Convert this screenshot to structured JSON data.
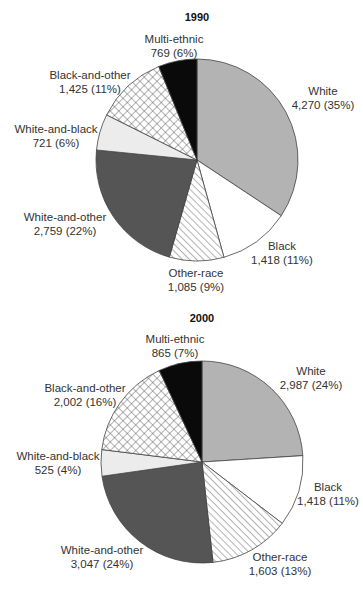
{
  "chart_data": [
    {
      "type": "pie",
      "title": "1990",
      "start_angle": "12 o'clock, clockwise",
      "categories": [
        "White",
        "Black",
        "Other-race",
        "White-and-other",
        "White-and-black",
        "Black-and-other",
        "Multi-ethnic"
      ],
      "values": [
        4270,
        1418,
        1085,
        2759,
        721,
        1425,
        769
      ],
      "percents": [
        35,
        11,
        9,
        22,
        6,
        11,
        6
      ],
      "labels": [
        {
          "name": "White",
          "value": "4,270 (35%)"
        },
        {
          "name": "Black",
          "value": "1,418 (11%)"
        },
        {
          "name": "Other-race",
          "value": "1,085 (9%)"
        },
        {
          "name": "White-and-other",
          "value": "2,759 (22%)"
        },
        {
          "name": "White-and-black",
          "value": "721 (6%)"
        },
        {
          "name": "Black-and-other",
          "value": "1,425 (11%)"
        },
        {
          "name": "Multi-ethnic",
          "value": "769 (6%)"
        }
      ]
    },
    {
      "type": "pie",
      "title": "2000",
      "start_angle": "12 o'clock, clockwise",
      "categories": [
        "White",
        "Black",
        "Other-race",
        "White-and-other",
        "White-and-black",
        "Black-and-other",
        "Multi-ethnic"
      ],
      "values": [
        2987,
        1418,
        1603,
        3047,
        525,
        2002,
        865
      ],
      "percents": [
        24,
        11,
        13,
        24,
        4,
        16,
        7
      ],
      "labels": [
        {
          "name": "White",
          "value": "2,987 (24%)"
        },
        {
          "name": "Black",
          "value": "1,418 (11%)"
        },
        {
          "name": "Other-race",
          "value": "1,603 (13%)"
        },
        {
          "name": "White-and-other",
          "value": "3,047 (24%)"
        },
        {
          "name": "White-and-black",
          "value": "525 (4%)"
        },
        {
          "name": "Black-and-other",
          "value": "2,002 (16%)"
        },
        {
          "name": "Multi-ethnic",
          "value": "865 (7%)"
        }
      ]
    }
  ],
  "fills": {
    "White": "#b3b3b3",
    "Black": "#ffffff",
    "Other-race": "diagonal-hatch",
    "White-and-other": "#555555",
    "White-and-black": "#ececec",
    "Black-and-other": "cross-hatch",
    "Multi-ethnic": "#0a0a0a"
  }
}
